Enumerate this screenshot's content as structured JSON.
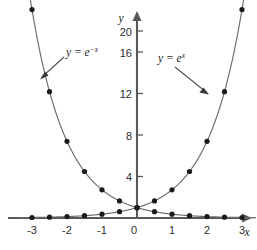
{
  "chart_data": {
    "type": "line",
    "title": "",
    "xlabel": "x",
    "ylabel": "y",
    "xlim": [
      -3.4,
      3.4
    ],
    "ylim": [
      0,
      21.5
    ],
    "grid": false,
    "legend": "inline-annotations",
    "x_ticks": [
      -3,
      -2,
      -1,
      0,
      1,
      2,
      3
    ],
    "x_tick_labels": [
      "-3",
      "-2",
      "-1",
      "0",
      "1",
      "2",
      "3"
    ],
    "y_ticks": [
      4,
      8,
      12,
      16,
      20
    ],
    "y_tick_labels": [
      "4",
      "8",
      "12",
      "16",
      "20"
    ],
    "marker_x": [
      -3,
      -2.5,
      -2,
      -1.5,
      -1,
      -0.5,
      0,
      0.5,
      1,
      1.5,
      2,
      2.5,
      3
    ],
    "series": [
      {
        "name": "y = e^{-x}",
        "label_text": "y = e",
        "label_exponent": "−x",
        "values": [
          20.09,
          12.18,
          7.39,
          4.48,
          2.72,
          1.65,
          1,
          0.61,
          0.37,
          0.22,
          0.14,
          0.08,
          0.05
        ]
      },
      {
        "name": "y = e^{x}",
        "label_text": "y = e",
        "label_exponent": "x",
        "values": [
          0.05,
          0.08,
          0.14,
          0.22,
          0.37,
          0.61,
          1,
          1.65,
          2.72,
          4.48,
          7.39,
          12.18,
          20.09
        ]
      }
    ],
    "colors": {
      "curve": "#6b6b6b",
      "marker": "#1b1b1b",
      "axis": "#585858",
      "text": "#1f1f1f"
    }
  },
  "annotations": {
    "left_label": {
      "base": "y = e",
      "exponent": "−x"
    },
    "right_label": {
      "base": "y = e",
      "exponent": "x"
    }
  },
  "axes": {
    "x_axis_name": "x",
    "y_axis_name": "y"
  }
}
